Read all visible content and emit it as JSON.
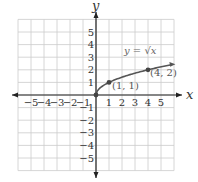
{
  "chart_data": {
    "type": "line",
    "title": "",
    "xlabel": "x",
    "ylabel": "y",
    "xlim": [
      -6,
      6
    ],
    "ylim": [
      -6,
      6
    ],
    "grid": true,
    "x_ticks": [
      -5,
      -4,
      -3,
      -2,
      -1,
      1,
      2,
      3,
      4,
      5
    ],
    "y_ticks": [
      -5,
      -4,
      -3,
      -2,
      -1,
      1,
      2,
      3,
      4,
      5
    ],
    "x_tick_labels": [
      "−5",
      "−4",
      "−3",
      "−2",
      "−1",
      "1",
      "2",
      "3",
      "4",
      "5"
    ],
    "y_tick_labels": [
      "−5",
      "−4",
      "−3",
      "−2",
      "−1",
      "1",
      "2",
      "3",
      "4",
      "5"
    ],
    "series": [
      {
        "name": "y = √x",
        "function": "sqrt(x)",
        "domain": [
          0,
          5.8
        ],
        "x": [
          0,
          0.25,
          1,
          2,
          3,
          4,
          5,
          5.8
        ],
        "y": [
          0,
          0.5,
          1,
          1.414,
          1.732,
          2,
          2.236,
          2.408
        ]
      }
    ],
    "points": [
      {
        "x": 0,
        "y": 0,
        "label": ""
      },
      {
        "x": 1,
        "y": 1,
        "label": "(1, 1)"
      },
      {
        "x": 4,
        "y": 2,
        "label": "(4, 2)"
      }
    ],
    "annotations": [
      {
        "text": "y = √x",
        "x": 3.3,
        "y": 3.6
      }
    ],
    "colors": {
      "grid": "#cccccc",
      "axis": "#222222",
      "curve": "#555555"
    }
  },
  "labels": {
    "x_axis": "x",
    "y_axis": "y",
    "equation": "y = √x",
    "point1": "(1, 1)",
    "point2": "(4, 2)"
  }
}
